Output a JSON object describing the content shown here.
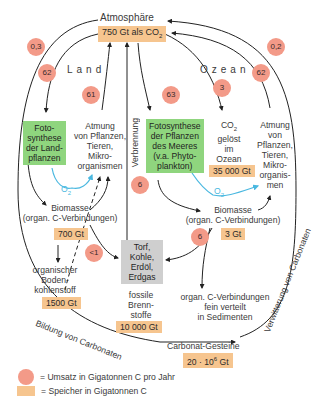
{
  "atmosphere": {
    "label": "Atmosphäre",
    "storage": "750 Gt als CO",
    "storage_sub": "2"
  },
  "sections": {
    "land": "Land",
    "ocean": "Ozean"
  },
  "flows": {
    "atm_to_carbonate_left": "0,3",
    "land_photosynthesis": "62",
    "land_respiration": "61",
    "ocean_photosynthesis": "63",
    "ocean_dissolved": "3",
    "ocean_respiration": "62",
    "weathering_right": "0,2",
    "combustion": "6",
    "biomass_to_fossil_land": "<1",
    "ocean_biomass_to_fossil": "6"
  },
  "land": {
    "photosynthesis": [
      "Foto-",
      "synthese",
      "der Land-",
      "pflanzen"
    ],
    "respiration": [
      "Atmung",
      "von Pflanzen,",
      "Tieren,",
      "Mikro-",
      "organismen"
    ],
    "o2": "O",
    "o2_sub": "2",
    "biomass": [
      "Biomasse",
      "(organ. C-Verbindungen)"
    ],
    "biomass_storage": "700 Gt",
    "soil_carbon": [
      "organischer",
      "Boden-",
      "kohlenstoff"
    ],
    "soil_storage": "1500 Gt"
  },
  "combustion_label": "Verbrennung",
  "fossil": {
    "box": [
      "Torf,",
      "Kohle,",
      "Erdöl,",
      "Erdgas"
    ],
    "label": [
      "fossile",
      "Brenn-",
      "stoffe"
    ],
    "storage": "10 000 Gt"
  },
  "ocean": {
    "photosynthesis": [
      "Fotosynthese",
      "der Pflanzen",
      "des Meeres",
      "(v.a. Phyto-",
      "plankton)"
    ],
    "co2": [
      "CO",
      "gelöst",
      "im",
      "Ozean"
    ],
    "co2_sub": "2",
    "co2_storage": "35 000 Gt",
    "respiration": [
      "Atmung",
      "von",
      "Pflanzen,",
      "Tieren,",
      "Mikro-",
      "organis-",
      "men"
    ],
    "o2": "O",
    "o2_sub": "2",
    "biomass": [
      "Biomasse",
      "(organ. C-Verbindungen)"
    ],
    "biomass_storage": "3 Gt",
    "sediments": [
      "organ. C-Verbindungen",
      "fein verteilt",
      "in Sedimenten"
    ]
  },
  "carbonate": {
    "label": "Carbonat-Gesteine",
    "storage": "20 · 10",
    "storage_sup": "6",
    "storage_unit": " Gt",
    "formation": "Bildung von Carbonaten",
    "weathering": "Verwitterung von Carbonaten"
  },
  "legend": {
    "flux": "= Umsatz in Gigatonnen C pro Jahr",
    "storage": "= Speicher in Gigatonnen C"
  },
  "colors": {
    "flux_badge": "#f39a88",
    "storage_box": "#f6c58f",
    "photosynthesis_box": "#8fd57e",
    "fossil_box": "#cfcfcf",
    "oxygen_arrow": "#4ab8e0",
    "arrow": "#222222"
  }
}
